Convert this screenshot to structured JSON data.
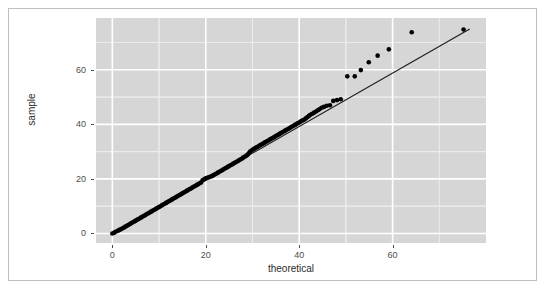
{
  "figure": {
    "background_color": "#ffffff",
    "frame_color": "#bfbfbf",
    "panel_color": "#d6d6d6",
    "grid_major_color": "#ffffff",
    "grid_minor_color": "#ececec",
    "point_color": "#000000",
    "line_color": "#1a1a1a"
  },
  "chart_data": {
    "type": "scatter",
    "title": "",
    "subtitle": "",
    "xlabel": "theoretical",
    "ylabel": "sample",
    "xlim": [
      -3.5,
      80.0
    ],
    "ylim": [
      -3.5,
      79.0
    ],
    "xticks": [
      0,
      20,
      40,
      60
    ],
    "yticks": [
      0,
      20,
      40,
      60
    ],
    "xtick_labels": [
      "0",
      "20",
      "40",
      "60"
    ],
    "ytick_labels": [
      "0",
      "20",
      "40",
      "60"
    ],
    "grid": true,
    "grid_major": true,
    "grid_minor": true,
    "legend": "none",
    "annotations": [],
    "reference_line": {
      "name": "qq-reference-line",
      "type": "line",
      "x": [
        0.0,
        76.5
      ],
      "y": [
        0.0,
        75.0
      ]
    },
    "series": [
      {
        "name": "sample-vs-theoretical",
        "marker": "filled-circle",
        "color": "#000000",
        "points": [
          [
            0.0,
            0.0
          ],
          [
            0.4,
            0.3
          ],
          [
            0.8,
            0.7
          ],
          [
            1.2,
            1.0
          ],
          [
            1.5,
            1.3
          ],
          [
            1.9,
            1.6
          ],
          [
            2.2,
            1.9
          ],
          [
            2.5,
            2.2
          ],
          [
            2.8,
            2.5
          ],
          [
            3.1,
            2.8
          ],
          [
            3.4,
            3.1
          ],
          [
            3.7,
            3.4
          ],
          [
            4.0,
            3.7
          ],
          [
            4.3,
            4.0
          ],
          [
            4.6,
            4.3
          ],
          [
            4.9,
            4.6
          ],
          [
            5.2,
            4.9
          ],
          [
            5.5,
            5.2
          ],
          [
            5.8,
            5.5
          ],
          [
            6.1,
            5.8
          ],
          [
            6.4,
            6.1
          ],
          [
            6.7,
            6.4
          ],
          [
            7.0,
            6.7
          ],
          [
            7.3,
            7.0
          ],
          [
            7.6,
            7.3
          ],
          [
            7.9,
            7.6
          ],
          [
            8.2,
            7.9
          ],
          [
            8.5,
            8.2
          ],
          [
            8.8,
            8.5
          ],
          [
            9.1,
            8.8
          ],
          [
            9.4,
            9.1
          ],
          [
            9.7,
            9.4
          ],
          [
            10.0,
            9.7
          ],
          [
            10.3,
            10.0
          ],
          [
            10.6,
            10.3
          ],
          [
            10.9,
            10.6
          ],
          [
            11.2,
            10.9
          ],
          [
            11.5,
            11.2
          ],
          [
            11.8,
            11.5
          ],
          [
            12.1,
            11.8
          ],
          [
            12.4,
            12.1
          ],
          [
            12.7,
            12.4
          ],
          [
            13.0,
            12.7
          ],
          [
            13.3,
            13.0
          ],
          [
            13.6,
            13.3
          ],
          [
            13.9,
            13.6
          ],
          [
            14.2,
            13.9
          ],
          [
            14.5,
            14.2
          ],
          [
            14.8,
            14.5
          ],
          [
            15.1,
            14.8
          ],
          [
            15.4,
            15.1
          ],
          [
            15.7,
            15.4
          ],
          [
            16.0,
            15.7
          ],
          [
            16.3,
            16.0
          ],
          [
            16.6,
            16.3
          ],
          [
            16.9,
            16.6
          ],
          [
            17.2,
            16.9
          ],
          [
            17.5,
            17.2
          ],
          [
            17.8,
            17.5
          ],
          [
            18.1,
            17.8
          ],
          [
            18.4,
            18.1
          ],
          [
            18.7,
            18.4
          ],
          [
            19.0,
            18.7
          ],
          [
            19.3,
            19.5
          ],
          [
            19.6,
            19.8
          ],
          [
            19.9,
            20.1
          ],
          [
            20.2,
            20.3
          ],
          [
            20.5,
            20.5
          ],
          [
            20.8,
            20.7
          ],
          [
            21.1,
            20.9
          ],
          [
            21.4,
            21.1
          ],
          [
            21.7,
            21.4
          ],
          [
            22.0,
            21.7
          ],
          [
            22.3,
            22.0
          ],
          [
            22.6,
            22.3
          ],
          [
            22.9,
            22.6
          ],
          [
            23.2,
            22.9
          ],
          [
            23.5,
            23.2
          ],
          [
            23.8,
            23.5
          ],
          [
            24.1,
            23.8
          ],
          [
            24.4,
            24.1
          ],
          [
            24.7,
            24.4
          ],
          [
            25.0,
            24.7
          ],
          [
            25.3,
            25.0
          ],
          [
            25.6,
            25.3
          ],
          [
            25.9,
            25.6
          ],
          [
            26.2,
            25.9
          ],
          [
            26.5,
            26.2
          ],
          [
            26.8,
            26.5
          ],
          [
            27.1,
            26.8
          ],
          [
            27.4,
            27.1
          ],
          [
            27.7,
            27.4
          ],
          [
            28.0,
            27.8
          ],
          [
            28.3,
            28.1
          ],
          [
            28.6,
            28.4
          ],
          [
            28.9,
            28.8
          ],
          [
            29.2,
            29.4
          ],
          [
            29.5,
            30.0
          ],
          [
            29.8,
            30.4
          ],
          [
            30.1,
            30.8
          ],
          [
            30.4,
            31.1
          ],
          [
            30.7,
            31.4
          ],
          [
            31.0,
            31.7
          ],
          [
            31.3,
            32.0
          ],
          [
            31.6,
            32.3
          ],
          [
            31.9,
            32.6
          ],
          [
            32.2,
            32.9
          ],
          [
            32.5,
            33.2
          ],
          [
            32.8,
            33.5
          ],
          [
            33.1,
            33.8
          ],
          [
            33.4,
            34.1
          ],
          [
            33.7,
            34.4
          ],
          [
            34.0,
            34.7
          ],
          [
            34.3,
            35.0
          ],
          [
            34.6,
            35.3
          ],
          [
            34.9,
            35.6
          ],
          [
            35.2,
            35.9
          ],
          [
            35.5,
            36.2
          ],
          [
            35.8,
            36.5
          ],
          [
            36.1,
            36.8
          ],
          [
            36.4,
            37.1
          ],
          [
            36.7,
            37.4
          ],
          [
            37.0,
            37.7
          ],
          [
            37.3,
            38.0
          ],
          [
            37.6,
            38.3
          ],
          [
            37.9,
            38.6
          ],
          [
            38.2,
            38.9
          ],
          [
            38.5,
            39.2
          ],
          [
            38.8,
            39.5
          ],
          [
            39.1,
            39.8
          ],
          [
            39.4,
            40.1
          ],
          [
            39.7,
            40.4
          ],
          [
            40.0,
            40.7
          ],
          [
            40.3,
            41.0
          ],
          [
            40.6,
            41.3
          ],
          [
            40.9,
            41.6
          ],
          [
            41.2,
            41.9
          ],
          [
            41.5,
            42.3
          ],
          [
            41.8,
            42.7
          ],
          [
            42.1,
            43.1
          ],
          [
            42.4,
            43.5
          ],
          [
            42.8,
            43.9
          ],
          [
            43.2,
            44.3
          ],
          [
            43.6,
            44.7
          ],
          [
            44.0,
            45.2
          ],
          [
            44.4,
            45.6
          ],
          [
            44.8,
            46.1
          ],
          [
            45.3,
            46.4
          ],
          [
            45.9,
            46.8
          ],
          [
            46.6,
            47.0
          ],
          [
            47.3,
            48.6
          ],
          [
            48.1,
            48.9
          ],
          [
            48.9,
            49.2
          ],
          [
            50.3,
            57.6
          ],
          [
            51.9,
            57.6
          ],
          [
            53.2,
            59.9
          ],
          [
            54.9,
            62.8
          ],
          [
            56.8,
            65.2
          ],
          [
            59.2,
            67.5
          ],
          [
            64.1,
            73.8
          ],
          [
            75.2,
            74.8
          ]
        ]
      }
    ]
  },
  "axes": {
    "x_title": "theoretical",
    "y_title": "sample"
  }
}
